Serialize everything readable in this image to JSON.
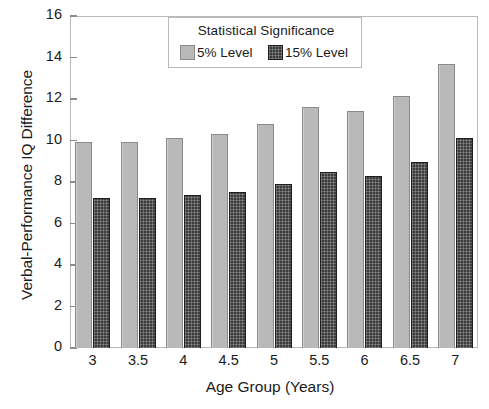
{
  "chart_data": {
    "type": "bar",
    "title": "",
    "xlabel": "Age Group (Years)",
    "ylabel": "Verbal-Performance IQ Difference",
    "categories": [
      "3",
      "3.5",
      "4",
      "4.5",
      "5",
      "5.5",
      "6",
      "6.5",
      "7"
    ],
    "series": [
      {
        "name": "5% Level",
        "color": "#b9b9b9",
        "values": [
          9.95,
          9.95,
          10.1,
          10.3,
          10.8,
          11.6,
          11.4,
          12.15,
          13.7
        ]
      },
      {
        "name": "15% Level",
        "color": "#3c3c3c",
        "values": [
          7.25,
          7.25,
          7.35,
          7.5,
          7.9,
          8.5,
          8.3,
          8.95,
          10.1
        ]
      }
    ],
    "ylim": [
      0,
      16
    ],
    "yticks": [
      "0",
      "2",
      "4",
      "6",
      "8",
      "10",
      "12",
      "14",
      "16"
    ],
    "ytick_values": [
      0,
      2,
      4,
      6,
      8,
      10,
      12,
      14,
      16
    ],
    "grid": false,
    "legend_position": "top-center",
    "legend_title": "Statistical Significance"
  },
  "legend": {
    "title": "Statistical Significance",
    "entries": [
      {
        "label": "5% Level",
        "swatch": "light-gray-solid"
      },
      {
        "label": "15% Level",
        "swatch": "dark-crosshatch"
      }
    ]
  },
  "axes": {
    "x_title": "Age Group (Years)",
    "y_title": "Verbal-Performance IQ Difference"
  },
  "colors": {
    "bar_light": "#b9b9b9",
    "bar_dark": "#3c3c3c",
    "frame": "#b9b9b9",
    "text": "#1b1b1b",
    "background": "#ffffff"
  }
}
